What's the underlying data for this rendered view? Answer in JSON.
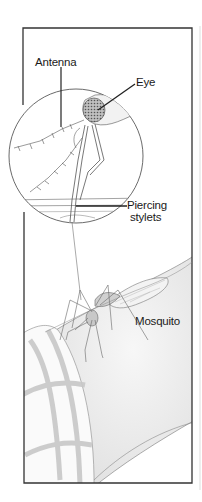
{
  "diagram": {
    "labels": {
      "antenna": "Antenna",
      "eye": "Eye",
      "piercing_stylets_line1": "Piercing",
      "piercing_stylets_line2": "stylets",
      "mosquito": "Mosquito"
    },
    "inset": {
      "description": "Magnified circular inset of mosquito head with stylets piercing skin layers"
    },
    "colors": {
      "line": "#222222",
      "frame": "#333333",
      "skin": "#ededed",
      "sleeve_stripe": "#c8c8c8",
      "background": "#ffffff"
    }
  }
}
